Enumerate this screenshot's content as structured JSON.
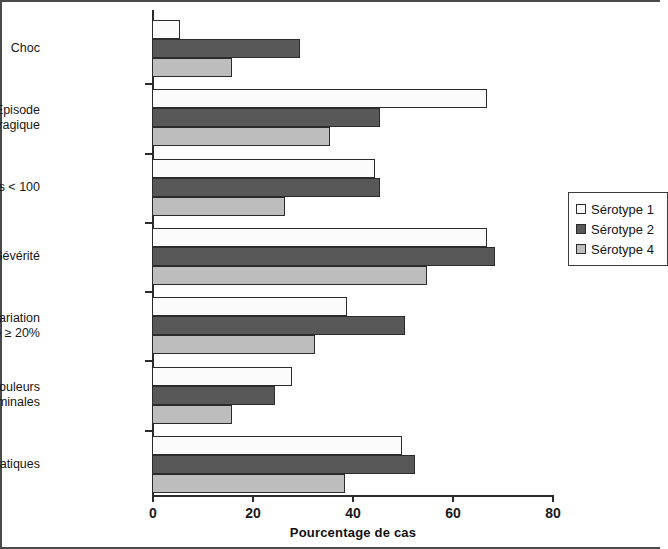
{
  "chart_data": {
    "type": "bar",
    "orientation": "horizontal",
    "title": "",
    "xlabel": "Pourcentage de cas",
    "ylabel": "",
    "xlim": [
      0,
      80
    ],
    "xticks": [
      "0",
      "20",
      "40",
      "60",
      "80"
    ],
    "grid": false,
    "legend_position": "right",
    "categories": [
      "Choc",
      "Episode\nhémorragique",
      "Plaquettes < 100",
      "Sévérité",
      "Variation\nd'hématocrite ≥ 20%",
      "Douleurs\nabdominales",
      "Signes hépatiques"
    ],
    "series": [
      {
        "name": "Sérotype 1",
        "color": "#fbfbfb",
        "values": [
          5.5,
          67,
          44.5,
          67,
          39,
          28,
          50
        ]
      },
      {
        "name": "Sérotype 2",
        "color": "#585858",
        "values": [
          29.5,
          45.5,
          45.5,
          68.5,
          50.5,
          24.5,
          52.5
        ]
      },
      {
        "name": "Sérotype 4",
        "color": "#bdbdbd",
        "values": [
          16,
          35.5,
          26.5,
          55,
          32.5,
          16,
          38.5
        ]
      }
    ]
  }
}
